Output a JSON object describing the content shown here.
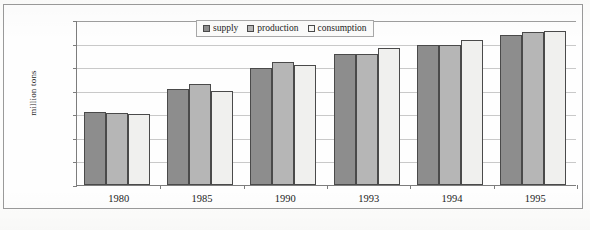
{
  "chart_data": {
    "type": "bar",
    "title": "",
    "xlabel": "",
    "ylabel": "million tons",
    "categories": [
      "1980",
      "1985",
      "1990",
      "1993",
      "1994",
      "1995"
    ],
    "series": [
      {
        "name": "supply",
        "values": [
          620,
          815,
          995,
          1115,
          1185,
          1275
        ]
      },
      {
        "name": "production",
        "values": [
          615,
          855,
          1045,
          1115,
          1185,
          1300
        ]
      },
      {
        "name": "consumption",
        "values": [
          600,
          795,
          1020,
          1165,
          1230,
          1310
        ]
      }
    ],
    "ylim": [
      0,
      1400
    ],
    "yticks": [
      0,
      200,
      400,
      600,
      800,
      1000,
      1200,
      1400
    ],
    "ytick_labels": [
      "0",
      "200",
      "400",
      "600",
      "800",
      "1 000",
      "1 200",
      "1 400"
    ],
    "grid": true,
    "legend_position": "top-center",
    "colors": {
      "supply": "#8d8d8d",
      "production": "#b6b6b6",
      "consumption": "#f0f0ee",
      "bar_outline": "#4a4a4a",
      "axis": "#7d7d7d",
      "gridline": "#c9c9c9",
      "frame": "#9a9a9a",
      "background": "#fdfdfc",
      "text": "#1c1c1c"
    }
  },
  "legend": {
    "items": [
      {
        "label": "supply"
      },
      {
        "label": "production"
      },
      {
        "label": "consumption"
      }
    ]
  }
}
